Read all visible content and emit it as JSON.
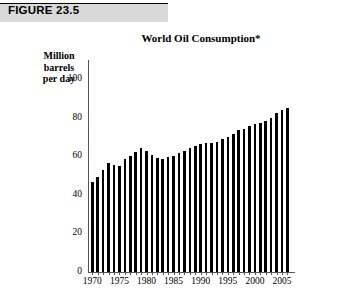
{
  "figure": {
    "label": "FIGURE 23.5"
  },
  "chart_data": {
    "type": "bar",
    "title": "World Oil Consumption*",
    "xlabel": "",
    "ylabel": "Million barrels per day",
    "ylabel_lines": [
      "Million",
      "barrels",
      "per day"
    ],
    "ylim": [
      0,
      110
    ],
    "yticks": [
      0,
      20,
      40,
      60,
      80,
      100
    ],
    "ytick_labels": [
      "0",
      "20",
      "40",
      "60",
      "80",
      "100"
    ],
    "xticks": [
      1970,
      1975,
      1980,
      1985,
      1990,
      1995,
      2000,
      2005
    ],
    "xtick_labels": [
      "1970",
      "1975",
      "1980",
      "1985",
      "1990",
      "1995",
      "2000",
      "2005"
    ],
    "grid": false,
    "legend": false,
    "bar_color": "#000000",
    "categories": [
      1970,
      1971,
      1972,
      1973,
      1974,
      1975,
      1976,
      1977,
      1978,
      1979,
      1980,
      1981,
      1982,
      1983,
      1984,
      1985,
      1986,
      1987,
      1988,
      1989,
      1990,
      1991,
      1992,
      1993,
      1994,
      1995,
      1996,
      1997,
      1998,
      1999,
      2000,
      2001,
      2002,
      2003,
      2004,
      2005,
      2006
    ],
    "values": [
      46.8,
      49.4,
      52.7,
      56.5,
      55.7,
      55.2,
      58.4,
      60.2,
      62.4,
      64.5,
      62.9,
      60.6,
      59.2,
      58.8,
      59.6,
      60.0,
      61.5,
      62.8,
      64.5,
      65.5,
      66.5,
      66.9,
      67.2,
      67.5,
      68.8,
      70.0,
      71.7,
      73.5,
      74.2,
      75.6,
      76.6,
      77.5,
      78.3,
      79.8,
      82.6,
      83.9,
      85.3
    ],
    "annotations": [
      "*"
    ]
  }
}
